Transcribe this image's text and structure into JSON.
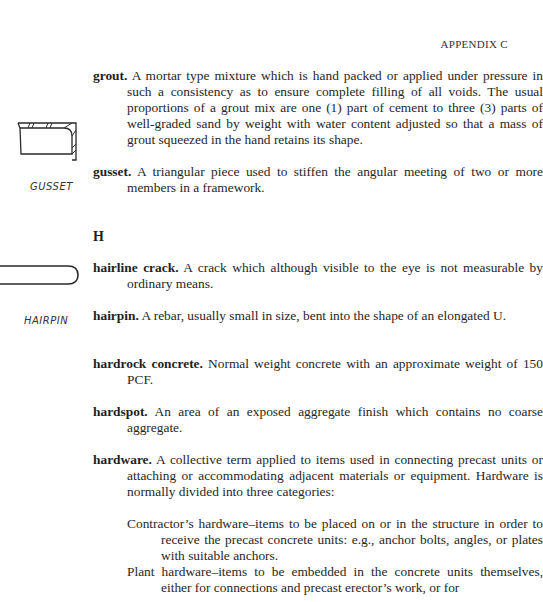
{
  "header": {
    "running_head": "APPENDIX C"
  },
  "figures": {
    "gusset": {
      "label": "GUSSET"
    },
    "hairpin": {
      "label": "HAIRPIN"
    }
  },
  "section_letter": "H",
  "entries": [
    {
      "term": "grout",
      "definition": "A mortar type mixture which is hand packed or applied under pressure in such a consistency as to ensure complete filling of all voids. The usual proportions of a grout mix are one (1) part of cement to three (3) parts of well-graded sand by weight with water content adjusted so that a mass of grout squeezed in the hand retains its shape."
    },
    {
      "term": "gusset",
      "definition": "A triangular piece used to stiffen the angular meeting of two or more members in a framework."
    },
    {
      "term": "hairline crack",
      "definition": "A crack which although visible to the eye is not measurable by ordinary means."
    },
    {
      "term": "hairpin",
      "definition": "A rebar, usually small in size, bent into the shape of an elongated U."
    },
    {
      "term": "hardrock concrete",
      "definition": "Normal weight concrete with an approximate weight of 150 PCF."
    },
    {
      "term": "hardspot",
      "definition": "An area of an exposed aggregate finish which contains no coarse aggregate."
    },
    {
      "term": "hardware",
      "definition": "A collective term applied to items used in connecting precast units or attaching or accommodating adjacent materials or equipment. Hardware is normally divided into three categories:"
    }
  ],
  "hardware_categories": [
    {
      "text": "Contractor’s hardware–items to be placed on or in the structure in order to receive the precast concrete units: e.g., anchor bolts, angles, or plates with suitable anchors."
    },
    {
      "text": "Plant hardware–items to be embedded in the concrete units themselves, either for connections and precast erector’s work, or for"
    }
  ]
}
